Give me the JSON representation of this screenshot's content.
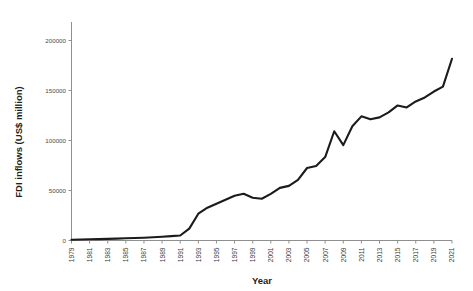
{
  "chart_data": {
    "type": "line",
    "title": "",
    "xlabel": "Year",
    "ylabel": "FDI inflows (US$ million)",
    "xlim": [
      1979,
      2021
    ],
    "ylim": [
      0,
      220000
    ],
    "ytick_values": [
      0,
      50000,
      100000,
      150000,
      200000
    ],
    "ytick_labels": [
      "0",
      "50000",
      "100000",
      "150000",
      "200000"
    ],
    "xtick_labels": [
      "1979",
      "1981",
      "1983",
      "1985",
      "1987",
      "1989",
      "1991",
      "1993",
      "1995",
      "1997",
      "1999",
      "2001",
      "2003",
      "2005",
      "2007",
      "2009",
      "2011",
      "2013",
      "2015",
      "2017",
      "2019",
      "2021"
    ],
    "xtick_label_rotation": -90,
    "grid": false,
    "legend": false,
    "line_color": "#1b1b1b",
    "x": [
      1979,
      1980,
      1981,
      1982,
      1983,
      1984,
      1985,
      1986,
      1987,
      1988,
      1989,
      1990,
      1991,
      1992,
      1993,
      1994,
      1995,
      1996,
      1997,
      1998,
      1999,
      2000,
      2001,
      2002,
      2003,
      2004,
      2005,
      2006,
      2007,
      2008,
      2009,
      2010,
      2011,
      2012,
      2013,
      2014,
      2015,
      2016,
      2017,
      2018,
      2019,
      2020,
      2021
    ],
    "values": [
      800,
      1000,
      1200,
      1400,
      1600,
      1900,
      2200,
      2500,
      2800,
      3200,
      3800,
      4400,
      5000,
      12000,
      27000,
      33000,
      37000,
      41000,
      45000,
      47000,
      43000,
      42000,
      47000,
      53000,
      55000,
      61000,
      73000,
      75000,
      84000,
      110000,
      96000,
      115000,
      125000,
      122000,
      124000,
      129000,
      136000,
      134000,
      140000,
      144000,
      150000,
      155000,
      183000
    ]
  }
}
